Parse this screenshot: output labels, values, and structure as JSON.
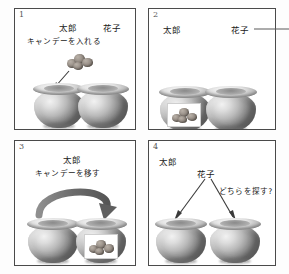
{
  "figure": {
    "title": "",
    "panel_count": 4
  },
  "panels": [
    {
      "number": "1",
      "name": "panel-put-candy-in",
      "labels": {
        "actor_left": "太郎",
        "actor_right": "花子",
        "action": "キャンデーを入れる"
      },
      "icons": {
        "candy": "candy-cluster-icon",
        "arrow": "down-left-arrow-icon",
        "pot_left": "pot-icon",
        "pot_right": "pot-icon"
      }
    },
    {
      "number": "2",
      "name": "panel-hanako-leaves",
      "labels": {
        "actor_left": "太郎",
        "actor_right": "花子",
        "action": ""
      },
      "icons": {
        "exit_arrow": "right-exit-arrow-icon",
        "pot_left_with_candy": "pot-with-candy-icon",
        "pot_right": "pot-icon"
      }
    },
    {
      "number": "3",
      "name": "panel-taro-moves-candy",
      "labels": {
        "actor_left": "太郎",
        "actor_right": "",
        "action": "キャンデーを移す"
      },
      "icons": {
        "transfer_arrow": "curved-transfer-arrow-icon",
        "pot_left": "pot-icon",
        "pot_right_with_candy": "pot-with-candy-icon"
      }
    },
    {
      "number": "4",
      "name": "panel-where-will-hanako-look",
      "labels": {
        "actor_left": "太郎",
        "actor_right": "花子",
        "action": "どちらを探す?"
      },
      "icons": {
        "arrow_left": "down-left-arrow-icon",
        "arrow_right": "down-right-arrow-icon",
        "pot_left": "pot-icon",
        "pot_right": "pot-icon"
      }
    }
  ],
  "colors": {
    "panel_border": "#4a4a4a",
    "page_background": "#fdfdfd",
    "panel_background": "#ffffff",
    "text": "#1a1a1a",
    "arrow": "#3a3a3a",
    "pot_gray": "#b9b9b9",
    "candy_brown": "#9a9189"
  }
}
